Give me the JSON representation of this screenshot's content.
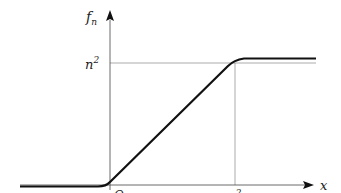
{
  "diagram": {
    "y_axis_label": {
      "base": "f",
      "sub": "n"
    },
    "x_axis_label": "x",
    "origin_label": "O",
    "y_tick_label": {
      "base": "n",
      "sup": "2"
    },
    "x_tick_label": {
      "base": "n",
      "sup": "2"
    },
    "colors": {
      "axis": "#222222",
      "curve": "#111111",
      "guide": "#888888"
    }
  }
}
